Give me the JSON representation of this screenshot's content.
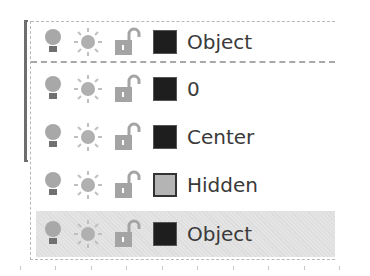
{
  "layer_control": {
    "current": {
      "name": "Object",
      "color": "#1e1e1e",
      "on": true,
      "thawed": true,
      "unlocked": true
    },
    "layers": [
      {
        "name": "0",
        "color": "#1e1e1e",
        "on": true,
        "thawed": true,
        "unlocked": true,
        "selected": false
      },
      {
        "name": "Center",
        "color": "#1e1e1e",
        "on": true,
        "thawed": true,
        "unlocked": true,
        "selected": false
      },
      {
        "name": "Hidden",
        "color": "#b4b4b4",
        "on": true,
        "thawed": true,
        "unlocked": true,
        "selected": false
      },
      {
        "name": "Object",
        "color": "#1e1e1e",
        "on": true,
        "thawed": true,
        "unlocked": true,
        "selected": true
      }
    ],
    "icons": {
      "on_off": "lightbulb-icon",
      "freeze_thaw": "sun-icon",
      "lock_unlock": "unlocked-padlock-icon",
      "color": "color-swatch-icon"
    },
    "icon_colors": {
      "bulb": "#a8a8a8",
      "bulb_base": "#707070",
      "sun": "#b0b0b0",
      "lock": "#a4a4a4",
      "selected_bg": "#e0e0e0"
    }
  }
}
